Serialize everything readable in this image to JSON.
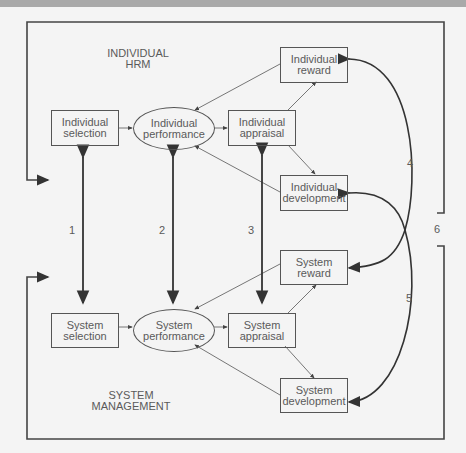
{
  "diagram": {
    "region_labels": {
      "top_line1": "INDIVIDUAL",
      "top_line2": "HRM",
      "bottom_line1": "SYSTEM",
      "bottom_line2": "MANAGEMENT"
    },
    "individual": {
      "selection": [
        "Individual",
        "selection"
      ],
      "performance": [
        "Individual",
        "performance"
      ],
      "appraisal": [
        "Individual",
        "appraisal"
      ],
      "reward": [
        "Individual",
        "reward"
      ],
      "development": [
        "Individual",
        "development"
      ]
    },
    "system": {
      "selection": [
        "System",
        "selection"
      ],
      "performance": [
        "System",
        "performance"
      ],
      "appraisal": [
        "System",
        "appraisal"
      ],
      "reward": [
        "System",
        "reward"
      ],
      "development": [
        "System",
        "development"
      ]
    },
    "link_numbers": [
      "1",
      "2",
      "3",
      "4",
      "5",
      "6"
    ],
    "colors": {
      "line": "#444444",
      "text": "#5a5a5a",
      "background": "#f4f4f4",
      "topbar": "#a9a9a9"
    }
  }
}
